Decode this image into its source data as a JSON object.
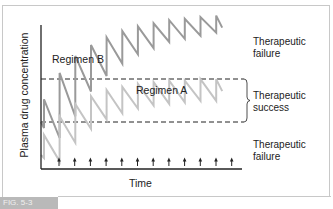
{
  "chart_data": {
    "type": "line",
    "title": "",
    "xlabel": "Time",
    "ylabel": "Plasma drug concentration",
    "grid": false,
    "dose_arrows": 12,
    "thresholds": [
      {
        "name": "upper",
        "style": "dashed",
        "level": "toxic/failure boundary"
      },
      {
        "name": "lower",
        "style": "dashed",
        "level": "minimum effective boundary"
      }
    ],
    "zones": [
      {
        "label": "Therapeutic failure",
        "position": "above upper threshold"
      },
      {
        "label": "Therapeutic success",
        "position": "between thresholds"
      },
      {
        "label": "Therapeutic failure",
        "position": "below lower threshold"
      }
    ],
    "series": [
      {
        "name": "Regimen B",
        "color": "#9a9a9a",
        "description": "sawtooth rising above upper threshold, accumulating each dose",
        "peaks_relative": [
          0.45,
          0.62,
          0.73,
          0.8,
          0.85,
          0.89,
          0.92,
          0.94,
          0.96,
          0.97,
          0.98,
          0.99
        ],
        "troughs_relative": [
          0.2,
          0.34,
          0.5,
          0.6,
          0.68,
          0.74,
          0.78,
          0.82,
          0.84,
          0.86,
          0.88,
          0.89
        ]
      },
      {
        "name": "Regimen A",
        "color": "#c4c4c4",
        "description": "sawtooth rising into and plateauing within therapeutic window",
        "peaks_relative": [
          0.22,
          0.34,
          0.42,
          0.47,
          0.51,
          0.53,
          0.55,
          0.56,
          0.57,
          0.57,
          0.58,
          0.58
        ],
        "troughs_relative": [
          0.05,
          0.17,
          0.26,
          0.32,
          0.36,
          0.39,
          0.41,
          0.42,
          0.43,
          0.44,
          0.44,
          0.45
        ]
      }
    ]
  },
  "labels": {
    "y_axis": "Plasma drug concentration",
    "x_axis": "Time",
    "regimen_b": "Regimen B",
    "regimen_a": "Regimen A",
    "top_zone_1": "Therapeutic",
    "top_zone_2": "failure",
    "mid_zone_1": "Therapeutic",
    "mid_zone_2": "success",
    "low_zone_1": "Therapeutic",
    "low_zone_2": "failure",
    "fig_tag": "FIG. 5-3"
  },
  "colors": {
    "regimen_b": "#9a9a9a",
    "regimen_a": "#c4c4c4",
    "axis": "#222222"
  }
}
